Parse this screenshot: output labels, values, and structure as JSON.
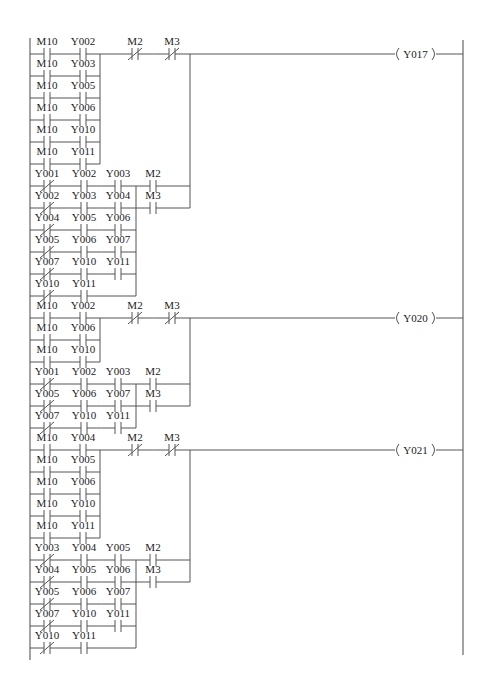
{
  "diagram": {
    "type": "PLC ladder diagram",
    "left_rail_x": 30,
    "right_rail_x": 463,
    "row_step": 22,
    "colors": {
      "wire": "#555555",
      "text": "#222222",
      "background": "#ffffff"
    }
  },
  "rungs": [
    {
      "id": "rung-1",
      "coil": "Y017",
      "wire_y": 54,
      "block_a": {
        "join_x": 100,
        "rows": [
          {
            "c1": {
              "name": "M10",
              "type": "NO"
            },
            "c2": {
              "name": "Y002",
              "type": "NO"
            }
          },
          {
            "c1": {
              "name": "M10",
              "type": "NO"
            },
            "c2": {
              "name": "Y003",
              "type": "NO"
            }
          },
          {
            "c1": {
              "name": "M10",
              "type": "NO"
            },
            "c2": {
              "name": "Y005",
              "type": "NO"
            }
          },
          {
            "c1": {
              "name": "M10",
              "type": "NO"
            },
            "c2": {
              "name": "Y006",
              "type": "NO"
            }
          },
          {
            "c1": {
              "name": "M10",
              "type": "NO"
            },
            "c2": {
              "name": "Y010",
              "type": "NO"
            }
          },
          {
            "c1": {
              "name": "M10",
              "type": "NO"
            },
            "c2": {
              "name": "Y011",
              "type": "NO"
            }
          }
        ]
      },
      "series": [
        {
          "name": "M2",
          "type": "NC"
        },
        {
          "name": "M3",
          "type": "NC"
        }
      ],
      "block_b": {
        "rows": [
          {
            "c1": {
              "name": "Y001",
              "type": "NC"
            },
            "c2": {
              "name": "Y002",
              "type": "NO"
            },
            "c3": {
              "name": "Y003",
              "type": "NO"
            }
          },
          {
            "c1": {
              "name": "Y002",
              "type": "NC"
            },
            "c2": {
              "name": "Y003",
              "type": "NO"
            },
            "c3": {
              "name": "Y004",
              "type": "NO"
            }
          },
          {
            "c1": {
              "name": "Y004",
              "type": "NC"
            },
            "c2": {
              "name": "Y005",
              "type": "NO"
            },
            "c3": {
              "name": "Y006",
              "type": "NO"
            }
          },
          {
            "c1": {
              "name": "Y005",
              "type": "NC"
            },
            "c2": {
              "name": "Y006",
              "type": "NO"
            },
            "c3": {
              "name": "Y007",
              "type": "NO"
            }
          },
          {
            "c1": {
              "name": "Y007",
              "type": "NC"
            },
            "c2": {
              "name": "Y010",
              "type": "NO"
            },
            "c3": {
              "name": "Y011",
              "type": "NO"
            }
          },
          {
            "c1": {
              "name": "Y010",
              "type": "NC"
            },
            "c2": {
              "name": "Y011",
              "type": "NO"
            },
            "c3": null
          }
        ],
        "parallel_out": [
          {
            "name": "M2",
            "type": "NO"
          },
          {
            "name": "M3",
            "type": "NO"
          }
        ]
      }
    },
    {
      "id": "rung-2",
      "coil": "Y020",
      "wire_y": 318,
      "block_a": {
        "join_x": 100,
        "rows": [
          {
            "c1": {
              "name": "M10",
              "type": "NO"
            },
            "c2": {
              "name": "Y002",
              "type": "NO"
            }
          },
          {
            "c1": {
              "name": "M10",
              "type": "NO"
            },
            "c2": {
              "name": "Y006",
              "type": "NO"
            }
          },
          {
            "c1": {
              "name": "M10",
              "type": "NO"
            },
            "c2": {
              "name": "Y010",
              "type": "NO"
            }
          }
        ]
      },
      "series": [
        {
          "name": "M2",
          "type": "NC"
        },
        {
          "name": "M3",
          "type": "NC"
        }
      ],
      "block_b": {
        "rows": [
          {
            "c1": {
              "name": "Y001",
              "type": "NC"
            },
            "c2": {
              "name": "Y002",
              "type": "NO"
            },
            "c3": {
              "name": "Y003",
              "type": "NO"
            }
          },
          {
            "c1": {
              "name": "Y005",
              "type": "NC"
            },
            "c2": {
              "name": "Y006",
              "type": "NO"
            },
            "c3": {
              "name": "Y007",
              "type": "NO"
            }
          },
          {
            "c1": {
              "name": "Y007",
              "type": "NC"
            },
            "c2": {
              "name": "Y010",
              "type": "NO"
            },
            "c3": {
              "name": "Y011",
              "type": "NO"
            }
          }
        ],
        "parallel_out": [
          {
            "name": "M2",
            "type": "NO"
          },
          {
            "name": "M3",
            "type": "NO"
          }
        ]
      }
    },
    {
      "id": "rung-3",
      "coil": "Y021",
      "wire_y": 450,
      "block_a": {
        "join_x": 100,
        "rows": [
          {
            "c1": {
              "name": "M10",
              "type": "NO"
            },
            "c2": {
              "name": "Y004",
              "type": "NO"
            }
          },
          {
            "c1": {
              "name": "M10",
              "type": "NO"
            },
            "c2": {
              "name": "Y005",
              "type": "NO"
            }
          },
          {
            "c1": {
              "name": "M10",
              "type": "NO"
            },
            "c2": {
              "name": "Y006",
              "type": "NO"
            }
          },
          {
            "c1": {
              "name": "M10",
              "type": "NO"
            },
            "c2": {
              "name": "Y010",
              "type": "NO"
            }
          },
          {
            "c1": {
              "name": "M10",
              "type": "NO"
            },
            "c2": {
              "name": "Y011",
              "type": "NO"
            }
          }
        ]
      },
      "series": [
        {
          "name": "M2",
          "type": "NC"
        },
        {
          "name": "M3",
          "type": "NC"
        }
      ],
      "block_b": {
        "rows": [
          {
            "c1": {
              "name": "Y003",
              "type": "NC"
            },
            "c2": {
              "name": "Y004",
              "type": "NO"
            },
            "c3": {
              "name": "Y005",
              "type": "NO"
            }
          },
          {
            "c1": {
              "name": "Y004",
              "type": "NC"
            },
            "c2": {
              "name": "Y005",
              "type": "NO"
            },
            "c3": {
              "name": "Y006",
              "type": "NO"
            }
          },
          {
            "c1": {
              "name": "Y005",
              "type": "NC"
            },
            "c2": {
              "name": "Y006",
              "type": "NO"
            },
            "c3": {
              "name": "Y007",
              "type": "NO"
            }
          },
          {
            "c1": {
              "name": "Y007",
              "type": "NC"
            },
            "c2": {
              "name": "Y010",
              "type": "NO"
            },
            "c3": {
              "name": "Y011",
              "type": "NO"
            }
          },
          {
            "c1": {
              "name": "Y010",
              "type": "NC"
            },
            "c2": {
              "name": "Y011",
              "type": "NO"
            },
            "c3": null
          }
        ],
        "parallel_out": [
          {
            "name": "M2",
            "type": "NO"
          },
          {
            "name": "M3",
            "type": "NO"
          }
        ]
      }
    }
  ]
}
